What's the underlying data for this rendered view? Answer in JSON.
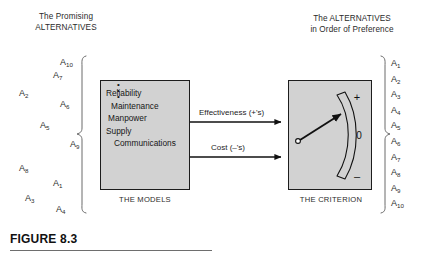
{
  "figure": {
    "caption": "FIGURE 8.3",
    "left_heading": "The Promising\nALTERNATIVES",
    "right_heading": "The ALTERNATIVES\nin Order of Preference"
  },
  "colors": {
    "box_fill": "#d2d2d2",
    "box_stroke": "#1d1d1d",
    "text": "#1a1a1a",
    "rule": "#6e6e6e",
    "page_background": "#ffffff"
  },
  "scatter_alternatives": [
    {
      "label": "A",
      "sub": "10",
      "x": 60,
      "y": 57
    },
    {
      "label": "A",
      "sub": "7",
      "x": 53,
      "y": 70
    },
    {
      "label": "A",
      "sub": "2",
      "x": 19,
      "y": 88
    },
    {
      "label": "A",
      "sub": "6",
      "x": 60,
      "y": 99
    },
    {
      "label": "A",
      "sub": "5",
      "x": 40,
      "y": 120
    },
    {
      "label": "A",
      "sub": "9",
      "x": 70,
      "y": 139
    },
    {
      "label": "A",
      "sub": "8",
      "x": 19,
      "y": 163
    },
    {
      "label": "A",
      "sub": "1",
      "x": 53,
      "y": 178
    },
    {
      "label": "A",
      "sub": "3",
      "x": 25,
      "y": 193
    },
    {
      "label": "A",
      "sub": "4",
      "x": 56,
      "y": 204
    }
  ],
  "ordered_alternatives": [
    {
      "label": "A",
      "sub": "1"
    },
    {
      "label": "A",
      "sub": "2"
    },
    {
      "label": "A",
      "sub": "3"
    },
    {
      "label": "A",
      "sub": "4"
    },
    {
      "label": "A",
      "sub": "5"
    },
    {
      "label": "A",
      "sub": "6"
    },
    {
      "label": "A",
      "sub": "7"
    },
    {
      "label": "A",
      "sub": "8"
    },
    {
      "label": "A",
      "sub": "9"
    },
    {
      "label": "A",
      "sub": "10"
    }
  ],
  "models_box": {
    "caption": "THE MODELS",
    "items": [
      "Reliability",
      "Maintenance",
      "Manpower",
      "Supply",
      "Communications"
    ],
    "continuation": "vertical-ellipsis"
  },
  "criterion_box": {
    "caption": "THE CRITERION",
    "gauge": {
      "scale_top_label": "+",
      "scale_middle_label": "0",
      "scale_bottom_label": "–",
      "needle_direction": "upper-right"
    }
  },
  "flows": [
    {
      "id": "effectiveness",
      "label": "Effectiveness (+'s)"
    },
    {
      "id": "cost",
      "label": "Cost   (–'s)"
    }
  ]
}
